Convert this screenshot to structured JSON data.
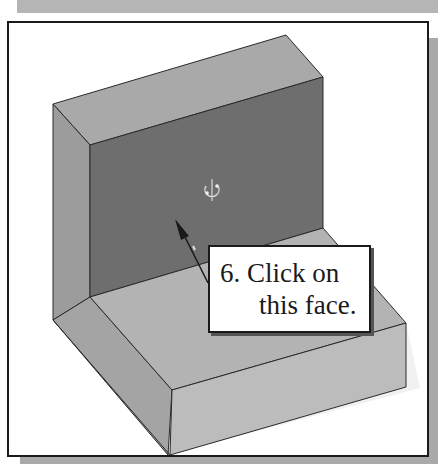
{
  "figure": {
    "callout": {
      "step_number": "6.",
      "line1": "6. Click on",
      "line2": "this face."
    },
    "cursor_icon": "rotate-cursor-icon",
    "colors": {
      "top_face": "#a9a9a9",
      "front_face_selected": "#6e6e6e",
      "side_face": "#9c9c9c",
      "base_top": "#b3b3b3",
      "base_front": "#bcbcbc",
      "base_side": "#a4a4a4",
      "edge": "#2a2a2a",
      "frame_border": "#1a1a1a",
      "page_band": "#b5b5b5"
    }
  }
}
